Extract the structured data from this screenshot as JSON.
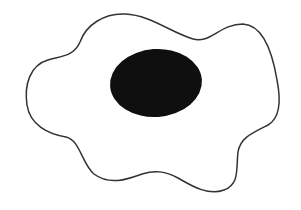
{
  "diagram": {
    "description": "Cell diagram: irregular wavy cell membrane outline with a solid dark oval nucleus",
    "background_color": "#ffffff",
    "cell": {
      "label": "cell membrane",
      "stroke_color": "#333333",
      "fill_color": "#ffffff",
      "stroke_width": 1.5
    },
    "nucleus": {
      "label": "nucleus",
      "fill_color": "#0f0f0f",
      "center": [
        156,
        83
      ],
      "radii": [
        46,
        34
      ]
    }
  }
}
